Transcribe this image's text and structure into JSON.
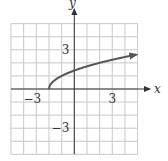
{
  "chart_data": {
    "type": "line",
    "title": "",
    "xlabel": "x",
    "ylabel": "y",
    "xlim": [
      -5,
      5
    ],
    "ylim": [
      -5,
      5
    ],
    "grid": true,
    "x_tick_labels": [
      {
        "value": -3,
        "label": "−3"
      },
      {
        "value": 3,
        "label": "3"
      }
    ],
    "y_tick_labels": [
      {
        "value": 3,
        "label": "3"
      },
      {
        "value": -3,
        "label": "−3"
      }
    ],
    "series": [
      {
        "name": "y = √(x + 2)",
        "x": [
          -2,
          -1.75,
          -1.5,
          -1,
          -0.5,
          0,
          0.5,
          1,
          1.5,
          2,
          2.5,
          3,
          3.5,
          4,
          4.5,
          4.9
        ],
        "y": [
          0,
          0.5,
          0.71,
          1,
          1.22,
          1.41,
          1.58,
          1.73,
          1.87,
          2,
          2.12,
          2.24,
          2.35,
          2.45,
          2.55,
          2.62
        ],
        "start_point": [
          -2,
          0
        ],
        "end_arrow": true,
        "color": "#555555"
      }
    ]
  },
  "colors": {
    "grid": "#c8c8c8",
    "axis": "#333333",
    "curve": "#555555"
  }
}
